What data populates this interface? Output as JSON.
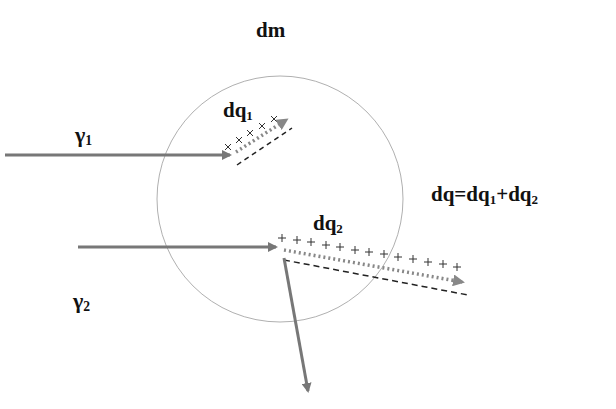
{
  "title": "dm",
  "labels": {
    "gamma1": {
      "base": "γ",
      "sub": "1"
    },
    "gamma2": {
      "base": "γ",
      "sub": "2"
    },
    "dq1": {
      "base": "dq",
      "sub": "1"
    },
    "dq2": {
      "base": "dq",
      "sub": "2"
    },
    "equation": {
      "lhs": "dq=dq",
      "sub1": "1",
      "mid": "+dq",
      "sub2": "2"
    }
  },
  "symbols": {
    "dq1_charge": "×",
    "dq2_charge": "+"
  },
  "colors": {
    "arrow": "#777777",
    "circle": "#aaaaaa",
    "text": "#111111",
    "dashed": "#222222"
  },
  "circle": {
    "cx": 280,
    "cy": 199,
    "r": 123
  }
}
